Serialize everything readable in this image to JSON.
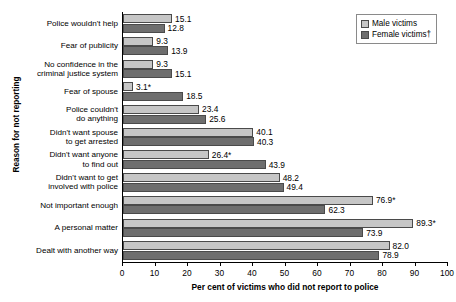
{
  "chart_data": {
    "type": "bar",
    "orientation": "horizontal",
    "title": "",
    "xlabel": "Per cent of victims who did not report to police",
    "ylabel": "Reason for not reporting",
    "xlim": [
      0,
      100
    ],
    "xticks": [
      0,
      10,
      20,
      30,
      40,
      50,
      60,
      70,
      80,
      90,
      100
    ],
    "grid": false,
    "legend_position": "top-right",
    "categories": [
      "Police wouldn't help",
      "Fear of publicity",
      "No confidence in the criminal justice system",
      "Fear of spouse",
      "Police couldn't do anything",
      "Didn't want spouse to get arrested",
      "Didn't want anyone to find out",
      "Didn't want to get involved with police",
      "Not important enough",
      "A personal matter",
      "Dealt with another way"
    ],
    "category_lines": [
      [
        "Police wouldn't help"
      ],
      [
        "Fear of publicity"
      ],
      [
        "No confidence in the",
        "criminal justice system"
      ],
      [
        "Fear of spouse"
      ],
      [
        "Police couldn't",
        "do anything"
      ],
      [
        "Didn't want spouse",
        "to get arrested"
      ],
      [
        "Didn't want anyone",
        "to find out"
      ],
      [
        "Didn't want to get",
        "involved with police"
      ],
      [
        "Not important enough"
      ],
      [
        "A personal matter"
      ],
      [
        "Dealt with another way"
      ]
    ],
    "series": [
      {
        "name": "Male victims",
        "color": "#c6c6c6",
        "values": [
          15.1,
          9.3,
          9.3,
          3.1,
          23.4,
          40.1,
          26.4,
          48.2,
          76.9,
          89.3,
          82.0
        ],
        "labels": [
          "15.1",
          "9.3",
          "9.3",
          "3.1*",
          "23.4",
          "40.1",
          "26.4*",
          "48.2",
          "76.9*",
          "89.3*",
          "82.0"
        ]
      },
      {
        "name": "Female victims†",
        "color": "#6e6e6e",
        "values": [
          12.8,
          13.9,
          15.1,
          18.5,
          25.6,
          40.3,
          43.9,
          49.4,
          62.3,
          73.9,
          78.9
        ],
        "labels": [
          "12.8",
          "13.9",
          "15.1",
          "18.5",
          "25.6",
          "40.3",
          "43.9",
          "49.4",
          "62.3",
          "73.9",
          "78.9"
        ]
      }
    ]
  },
  "legend": {
    "items": [
      {
        "label": "Male victims",
        "key": "male"
      },
      {
        "label": "Female victims†",
        "key": "female"
      }
    ]
  }
}
